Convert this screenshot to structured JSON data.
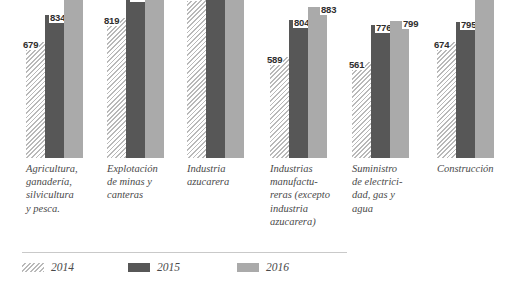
{
  "chart_data": {
    "type": "bar",
    "title": "",
    "subtitle": "",
    "xlabel": "",
    "ylabel": "",
    "grid": false,
    "legend_position": "bottom",
    "ylim": [
      0,
      1400
    ],
    "categories": [
      "Agricultura, ganadería, silvicultura y pesca.",
      "Explotación de minas y canteras",
      "Industria azucarera",
      "Industrias manufactureras (excepto industria azucarera)",
      "Suministro de electricidad, gas y agua",
      "Construcción"
    ],
    "category_lines": [
      [
        "Agricultura,",
        "ganadería,",
        "silvicultura",
        "y pesca."
      ],
      [
        "Explotación",
        "de minas y",
        "canteras"
      ],
      [
        "Industria",
        "azucarera"
      ],
      [
        "Industrias",
        "manufactu-",
        "reras (excepto",
        "industria",
        "azucarera)"
      ],
      [
        "Suministro",
        "de electrici-",
        "dad, gas y",
        "agua"
      ],
      [
        "Construcción"
      ]
    ],
    "series": [
      {
        "name": "2014",
        "color": "#f2f2f2",
        "pattern": "diagonal-hatch",
        "values": [
          679,
          819,
          963,
          589,
          561,
          674
        ],
        "labels": [
          "679",
          "819",
          "963",
          "589",
          "561",
          "674"
        ]
      },
      {
        "name": "2015",
        "color": "#575757",
        "pattern": "solid",
        "values": [
          834,
          958,
          1147,
          804,
          776,
          795
        ],
        "labels": [
          "834",
          "958",
          "1 147",
          "804",
          "776",
          "795"
        ]
      },
      {
        "name": "2016",
        "color": "#aaaaaa",
        "pattern": "solid",
        "values": [
          991,
          1218,
          1246,
          883,
          799,
          985
        ],
        "labels": [
          "991",
          "1 218",
          "1 246",
          "883",
          "799",
          "985"
        ]
      }
    ]
  },
  "legend": {
    "items": [
      {
        "label": "2014",
        "color": "#f2f2f2"
      },
      {
        "label": "2015",
        "color": "#575757"
      },
      {
        "label": "2016",
        "color": "#aaaaaa"
      }
    ]
  }
}
